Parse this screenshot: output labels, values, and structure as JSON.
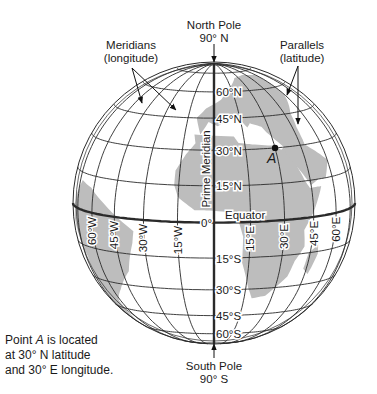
{
  "diagram": {
    "north_pole": {
      "title": "North Pole",
      "value": "90° N"
    },
    "south_pole": {
      "title": "South Pole",
      "value": "90° S"
    },
    "meridians_label": {
      "title": "Meridians",
      "sub": "(longitude)"
    },
    "parallels_label": {
      "title": "Parallels",
      "sub": "(latitude)"
    },
    "prime_meridian_label": "Prime Meridian",
    "equator_label": "Equator",
    "origin_label": "0°",
    "point_label": "A",
    "latitude_labels": [
      "60°N",
      "45°N",
      "30°N",
      "15°N",
      "15°S",
      "30°S",
      "45°S",
      "60°S"
    ],
    "longitude_labels_west": [
      "60°W",
      "45°W",
      "30°W",
      "15°W"
    ],
    "longitude_labels_east": [
      "15°E",
      "30°E",
      "45°E",
      "60°E"
    ],
    "caption": {
      "line1_prefix": "Point ",
      "line1_point": "A",
      "line1_suffix": " is located",
      "line2": "at 30° N latitude",
      "line3": "and 30° E longitude."
    }
  },
  "geometry": {
    "center": [
      214,
      203
    ],
    "radius": 141,
    "tilt_deg": 8,
    "parallels": [
      -75,
      -60,
      -45,
      -30,
      -15,
      0,
      15,
      30,
      45,
      60,
      75
    ],
    "meridians": [
      -75,
      -60,
      -45,
      -30,
      -15,
      0,
      15,
      30,
      45,
      60,
      75
    ],
    "point_a": {
      "lat": 30,
      "lon": 30
    }
  },
  "colors": {
    "land": "#bdbdbd",
    "line": "#2a2a2a",
    "background": "#ffffff"
  }
}
